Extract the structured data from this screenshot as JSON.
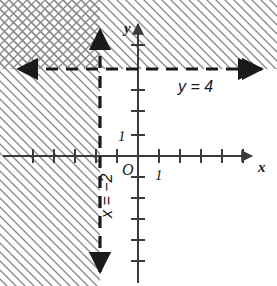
{
  "figure": {
    "width": 277,
    "height": 286,
    "background_color": "#ffffff"
  },
  "axes": {
    "x_axis_label": "x",
    "y_axis_label": "y",
    "origin_label": "O",
    "x_unit_label": "1",
    "y_unit_label": "1",
    "axis_color": "#3b3b3b",
    "tick_color": "#3b3b3b",
    "origin_px": {
      "x": 138,
      "y": 156
    },
    "unit_px": 21,
    "x_range": [
      -6,
      6.5
    ],
    "y_range": [
      -6.5,
      6.2
    ],
    "x_ticks": [
      -5,
      -4,
      -3,
      -2,
      -1,
      1,
      2,
      3,
      4,
      5
    ],
    "y_ticks": [
      -5,
      -4,
      -3,
      -2,
      -1,
      1,
      2,
      3,
      4,
      5
    ]
  },
  "boundary_lines": [
    {
      "id": "line-y-equals-4",
      "label": "y = 4",
      "equation_value": 4,
      "orientation": "horizontal",
      "style": "dashed",
      "strict": true,
      "color": "#1a1a1a",
      "arrows": "both",
      "label_position_px": {
        "x": 180,
        "y": 80
      }
    },
    {
      "id": "line-x-equals-neg2",
      "label": "x = −2",
      "equation_value": -2,
      "orientation": "vertical",
      "style": "dashed",
      "strict": true,
      "color": "#1a1a1a",
      "arrows": "both",
      "label_position_px": {
        "x": 112,
        "y": 215
      },
      "label_rotation_deg": -90
    }
  ],
  "shaded_regions": [
    {
      "id": "region-y-greater-than-4",
      "description": "Region above the line y = 4",
      "hatch_direction": "backslash",
      "hatch_color": "#8c8c8c"
    },
    {
      "id": "region-x-less-than-neg2",
      "description": "Region to the left of the line x = -2",
      "hatch_direction": "backslash",
      "hatch_color": "#8c8c8c"
    },
    {
      "id": "region-overlap-solution",
      "description": "Overlap of both regions, upper-left, shown as cross-hatching",
      "hatch_direction": "cross",
      "hatch_color": "#6e6e6e"
    }
  ],
  "inequalities": [
    "y > 4",
    "x < −2"
  ]
}
